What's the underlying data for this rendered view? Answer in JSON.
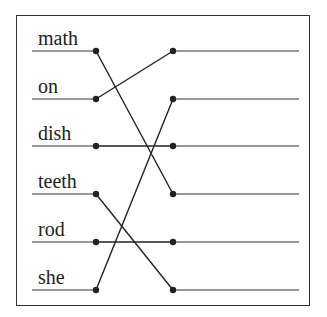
{
  "diagram": {
    "type": "matching-lines",
    "left_words": [
      "math",
      "on",
      "dish",
      "teeth",
      "rod",
      "she"
    ],
    "row_y": [
      51,
      99,
      146,
      194,
      242,
      290
    ],
    "connections": [
      {
        "from": 0,
        "to": 3
      },
      {
        "from": 1,
        "to": 0
      },
      {
        "from": 2,
        "to": 2
      },
      {
        "from": 3,
        "to": 5
      },
      {
        "from": 4,
        "to": 4
      },
      {
        "from": 5,
        "to": 1
      }
    ],
    "colors": {
      "line": "#777777",
      "connector": "#222222",
      "frame": "#333333",
      "text": "#222222"
    }
  }
}
